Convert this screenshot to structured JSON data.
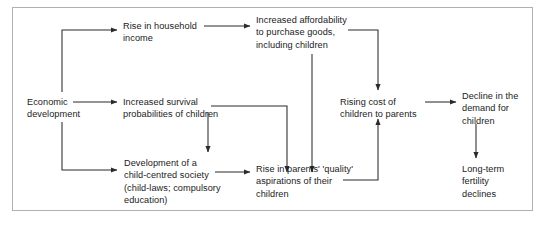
{
  "diagram": {
    "frame": {
      "stroke": "#b0b0b0"
    },
    "edge_color": "#2b2b2b",
    "nodes": [
      {
        "id": "economic-development",
        "label": "Economic\ndevelopment",
        "x": 27,
        "y": 96
      },
      {
        "id": "rise-household-income",
        "label": "Rise in household\nincome",
        "x": 123,
        "y": 20
      },
      {
        "id": "increased-survival-probabilities",
        "label": "Increased survival\nprobabilities of children",
        "x": 123,
        "y": 96
      },
      {
        "id": "child-centred-society",
        "label": "Development of a\nchild-centred society\n(child-laws; compulsory\neducation)",
        "x": 124,
        "y": 157
      },
      {
        "id": "increased-affordability",
        "label": "Increased affordability\nto purchase goods,\nincluding children",
        "x": 256,
        "y": 14
      },
      {
        "id": "quality-aspirations",
        "label": "Rise in parents' 'quality'\naspirations of their\nchildren",
        "x": 256,
        "y": 163
      },
      {
        "id": "rising-cost-of-children",
        "label": "Rising cost of\nchildren to parents",
        "x": 340,
        "y": 96
      },
      {
        "id": "decline-demand-children",
        "label": "Decline in the\ndemand for\nchildren",
        "x": 462,
        "y": 90
      },
      {
        "id": "long-term-fertility-declines",
        "label": "Long-term\nfertility\ndeclines",
        "x": 462,
        "y": 163
      }
    ],
    "edges": [
      {
        "id": "economic-development-to-rise-household-income",
        "from": "economic-development",
        "to": "rise-household-income"
      },
      {
        "id": "economic-development-to-increased-survival",
        "from": "economic-development",
        "to": "increased-survival-probabilities"
      },
      {
        "id": "economic-development-to-child-centred-society",
        "from": "economic-development",
        "to": "child-centred-society"
      },
      {
        "id": "rise-household-income-to-increased-affordability",
        "from": "rise-household-income",
        "to": "increased-affordability"
      },
      {
        "id": "increased-survival-to-child-centred-society",
        "from": "increased-survival-probabilities",
        "to": "child-centred-society"
      },
      {
        "id": "increased-survival-to-quality-aspirations",
        "from": "increased-survival-probabilities",
        "to": "quality-aspirations"
      },
      {
        "id": "increased-affordability-to-quality-aspirations",
        "from": "increased-affordability",
        "to": "quality-aspirations"
      },
      {
        "id": "increased-affordability-to-rising-cost",
        "from": "increased-affordability",
        "to": "rising-cost-of-children"
      },
      {
        "id": "child-centred-society-to-quality-aspirations",
        "from": "child-centred-society",
        "to": "quality-aspirations"
      },
      {
        "id": "quality-aspirations-to-rising-cost",
        "from": "quality-aspirations",
        "to": "rising-cost-of-children"
      },
      {
        "id": "rising-cost-to-decline-demand",
        "from": "rising-cost-of-children",
        "to": "decline-demand-children"
      },
      {
        "id": "decline-demand-to-long-term-fertility",
        "from": "decline-demand-children",
        "to": "long-term-fertility-declines"
      }
    ]
  }
}
